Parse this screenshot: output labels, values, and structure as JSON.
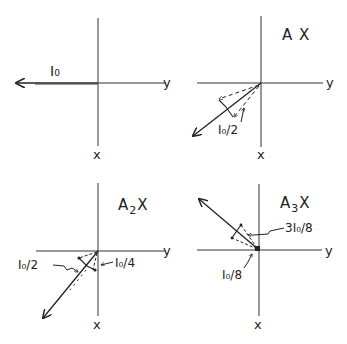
{
  "figure": {
    "panels": [
      {
        "id": "panel-1",
        "title": "",
        "axis_labels": {
          "horizontal": "y",
          "vertical": "x"
        },
        "vector_labels": [
          "I₀"
        ]
      },
      {
        "id": "panel-2",
        "title_main": "A",
        "title_sub": "",
        "title_tail": "X",
        "axis_labels": {
          "horizontal": "y",
          "vertical": "x"
        },
        "vector_labels": [
          "I₀/2"
        ]
      },
      {
        "id": "panel-3",
        "title_main": "A",
        "title_sub": "2",
        "title_tail": "X",
        "axis_labels": {
          "horizontal": "y",
          "vertical": "x"
        },
        "vector_labels": [
          "I₀/2",
          "I₀/4"
        ]
      },
      {
        "id": "panel-4",
        "title_main": "A",
        "title_sub": "3",
        "title_tail": "X",
        "axis_labels": {
          "horizontal": "y",
          "vertical": "x"
        },
        "vector_labels": [
          "3I₀/8",
          "I₀/8"
        ]
      }
    ],
    "colors": {
      "ink": "#222222",
      "background": "#ffffff"
    }
  }
}
